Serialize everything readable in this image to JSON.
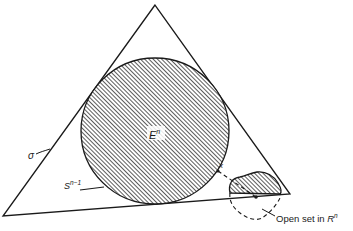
{
  "figure": {
    "labels": {
      "disk": "E",
      "disk_sup": "n",
      "sphere": "S",
      "sphere_sup": "n−1",
      "simplex": "σ",
      "point": "x",
      "open_set_prefix": "Open set in ",
      "open_set_space": "R",
      "open_set_sup": "n"
    },
    "colors": {
      "line": "#1a1a1a",
      "hatch_fill": "#8a8a8a",
      "background": "#ffffff"
    }
  }
}
